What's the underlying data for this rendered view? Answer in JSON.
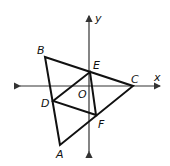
{
  "diagram": {
    "axes": {
      "x_label": "x",
      "y_label": "y",
      "origin_label": "O"
    },
    "points": {
      "A": {
        "label": "A",
        "x": 60,
        "y": 145
      },
      "B": {
        "label": "B",
        "x": 45,
        "y": 57
      },
      "C": {
        "label": "C",
        "x": 133,
        "y": 86
      },
      "D": {
        "label": "D",
        "x": 53,
        "y": 101
      },
      "E": {
        "label": "E",
        "x": 90,
        "y": 72
      },
      "F": {
        "label": "F",
        "x": 96,
        "y": 115
      }
    },
    "segments": [
      "AB",
      "BC",
      "CA",
      "DE",
      "EF",
      "FD"
    ],
    "colors": {
      "stroke": "#111111",
      "axis": "#333333",
      "background": "#ffffff"
    }
  }
}
